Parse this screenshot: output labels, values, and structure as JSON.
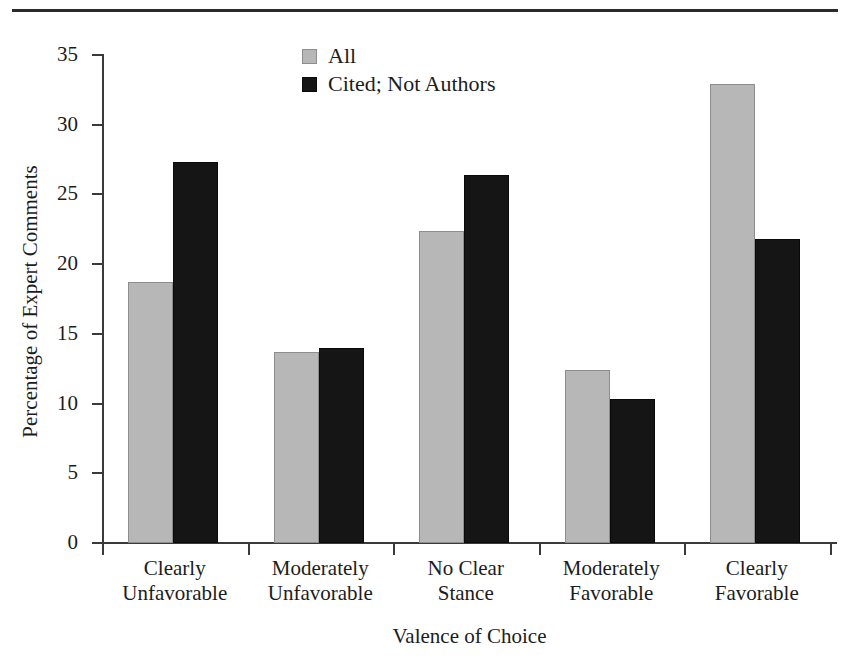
{
  "chart_data": {
    "type": "bar",
    "title": "",
    "xlabel": "Valence of Choice",
    "ylabel": "Percentage of Expert Comments",
    "categories": [
      "Clearly Unfavorable",
      "Moderately Unfavorable",
      "No Clear Stance",
      "Moderately Favorable",
      "Clearly Favorable"
    ],
    "category_lines": [
      [
        "Clearly",
        "Unfavorable"
      ],
      [
        "Moderately",
        "Unfavorable"
      ],
      [
        "No Clear",
        "Stance"
      ],
      [
        "Moderately",
        "Favorable"
      ],
      [
        "Clearly",
        "Favorable"
      ]
    ],
    "series": [
      {
        "name": "All",
        "color": "#b7b7b7",
        "values": [
          18.7,
          13.7,
          22.4,
          12.4,
          32.9
        ]
      },
      {
        "name": "Cited; Not Authors",
        "color": "#151515",
        "values": [
          27.3,
          14.0,
          26.4,
          10.3,
          21.8
        ]
      }
    ],
    "ylim": [
      0,
      35
    ],
    "yticks": [
      0,
      5,
      10,
      15,
      20,
      25,
      30,
      35
    ],
    "ytick_labels": [
      "0",
      "5",
      "10",
      "15",
      "20",
      "25",
      "30",
      "35"
    ],
    "grid": false,
    "legend_position": "top-center"
  },
  "legend": {
    "entries": [
      {
        "label": "All",
        "swatch": "gray-square-swatch"
      },
      {
        "label": "Cited; Not Authors",
        "swatch": "black-square-swatch"
      }
    ]
  },
  "axes": {
    "y_title": "Percentage of Expert Comments",
    "x_title": "Valence of Choice"
  }
}
